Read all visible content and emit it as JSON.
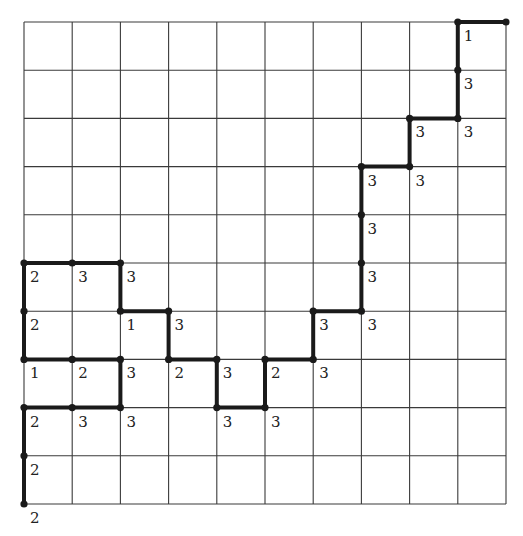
{
  "diagram": {
    "type": "lattice-path-grid",
    "grid": {
      "columns": 10,
      "rows": 10,
      "origin_px": [
        24,
        22
      ],
      "cell_px": 48.2,
      "line_color": "#3a3a3a"
    },
    "path_color": "#1a1a1a",
    "edges": [
      [
        [
          0,
          10
        ],
        [
          0,
          9
        ]
      ],
      [
        [
          0,
          9
        ],
        [
          0,
          8
        ]
      ],
      [
        [
          0,
          8
        ],
        [
          1,
          8
        ]
      ],
      [
        [
          1,
          8
        ],
        [
          2,
          8
        ]
      ],
      [
        [
          2,
          8
        ],
        [
          2,
          7
        ]
      ],
      [
        [
          2,
          7
        ],
        [
          1,
          7
        ]
      ],
      [
        [
          1,
          7
        ],
        [
          0,
          7
        ]
      ],
      [
        [
          0,
          7
        ],
        [
          0,
          6
        ]
      ],
      [
        [
          0,
          6
        ],
        [
          0,
          5
        ]
      ],
      [
        [
          0,
          5
        ],
        [
          1,
          5
        ]
      ],
      [
        [
          1,
          5
        ],
        [
          2,
          5
        ]
      ],
      [
        [
          2,
          5
        ],
        [
          2,
          6
        ]
      ],
      [
        [
          2,
          6
        ],
        [
          3,
          6
        ]
      ],
      [
        [
          3,
          6
        ],
        [
          3,
          7
        ]
      ],
      [
        [
          3,
          7
        ],
        [
          4,
          7
        ]
      ],
      [
        [
          4,
          7
        ],
        [
          4,
          8
        ]
      ],
      [
        [
          4,
          8
        ],
        [
          5,
          8
        ]
      ],
      [
        [
          5,
          8
        ],
        [
          5,
          7
        ]
      ],
      [
        [
          5,
          7
        ],
        [
          6,
          7
        ]
      ],
      [
        [
          6,
          7
        ],
        [
          6,
          6
        ]
      ],
      [
        [
          6,
          6
        ],
        [
          7,
          6
        ]
      ],
      [
        [
          7,
          6
        ],
        [
          7,
          5
        ]
      ],
      [
        [
          7,
          5
        ],
        [
          7,
          4
        ]
      ],
      [
        [
          7,
          4
        ],
        [
          7,
          3
        ]
      ],
      [
        [
          7,
          3
        ],
        [
          8,
          3
        ]
      ],
      [
        [
          8,
          3
        ],
        [
          8,
          2
        ]
      ],
      [
        [
          8,
          2
        ],
        [
          9,
          2
        ]
      ],
      [
        [
          9,
          2
        ],
        [
          9,
          1
        ]
      ],
      [
        [
          9,
          1
        ],
        [
          9,
          0
        ]
      ],
      [
        [
          9,
          0
        ],
        [
          10,
          0
        ]
      ]
    ],
    "vertices": [
      {
        "pos": [
          0,
          10
        ],
        "label": "2"
      },
      {
        "pos": [
          0,
          9
        ],
        "label": "2"
      },
      {
        "pos": [
          0,
          8
        ],
        "label": "2"
      },
      {
        "pos": [
          1,
          8
        ],
        "label": "3"
      },
      {
        "pos": [
          2,
          8
        ],
        "label": "3"
      },
      {
        "pos": [
          0,
          7
        ],
        "label": "1"
      },
      {
        "pos": [
          1,
          7
        ],
        "label": "2"
      },
      {
        "pos": [
          2,
          7
        ],
        "label": "3"
      },
      {
        "pos": [
          3,
          7
        ],
        "label": "2"
      },
      {
        "pos": [
          4,
          7
        ],
        "label": "3"
      },
      {
        "pos": [
          5,
          7
        ],
        "label": "2"
      },
      {
        "pos": [
          6,
          7
        ],
        "label": "3"
      },
      {
        "pos": [
          4,
          8
        ],
        "label": "3"
      },
      {
        "pos": [
          5,
          8
        ],
        "label": "3"
      },
      {
        "pos": [
          0,
          6
        ],
        "label": "2"
      },
      {
        "pos": [
          2,
          6
        ],
        "label": "1"
      },
      {
        "pos": [
          3,
          6
        ],
        "label": "3"
      },
      {
        "pos": [
          6,
          6
        ],
        "label": "3"
      },
      {
        "pos": [
          7,
          6
        ],
        "label": "3"
      },
      {
        "pos": [
          0,
          5
        ],
        "label": "2"
      },
      {
        "pos": [
          1,
          5
        ],
        "label": "3"
      },
      {
        "pos": [
          2,
          5
        ],
        "label": "3"
      },
      {
        "pos": [
          7,
          5
        ],
        "label": "3"
      },
      {
        "pos": [
          7,
          4
        ],
        "label": "3"
      },
      {
        "pos": [
          7,
          3
        ],
        "label": "3"
      },
      {
        "pos": [
          8,
          3
        ],
        "label": "3"
      },
      {
        "pos": [
          8,
          2
        ],
        "label": "3"
      },
      {
        "pos": [
          9,
          2
        ],
        "label": "3"
      },
      {
        "pos": [
          9,
          1
        ],
        "label": "3"
      },
      {
        "pos": [
          9,
          0
        ],
        "label": "1"
      },
      {
        "pos": [
          10,
          0
        ],
        "label": ""
      }
    ]
  }
}
